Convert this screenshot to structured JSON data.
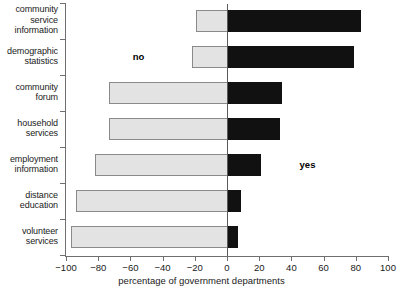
{
  "chart_data": {
    "type": "bar",
    "orientation": "horizontal",
    "subtype": "diverging-stacked",
    "title": "",
    "xlabel": "percentage of government departments",
    "ylabel": "",
    "xlim": [
      -100,
      100
    ],
    "xticks": [
      -100,
      -80,
      -60,
      -40,
      -20,
      0,
      20,
      40,
      60,
      80,
      100
    ],
    "xtick_labels": [
      "−100",
      "−80",
      "−60",
      "−40",
      "−20",
      "0",
      "20",
      "40",
      "60",
      "80",
      "100"
    ],
    "grid": false,
    "legend": {
      "position": "inline",
      "entries": [
        {
          "name": "no",
          "color": "#e3e3e3",
          "label": "no"
        },
        {
          "name": "yes",
          "color": "#111111",
          "label": "yes"
        }
      ]
    },
    "annotations": [
      {
        "text": "no",
        "x": -55,
        "row": 1
      },
      {
        "text": "yes",
        "x": 50,
        "row": 4
      }
    ],
    "categories": [
      "community service information",
      "demographic statistics",
      "community forum",
      "household services",
      "employment information",
      "distance education",
      "volunteer services"
    ],
    "category_lines": [
      [
        "community",
        "service",
        "information"
      ],
      [
        "demographic",
        "statistics"
      ],
      [
        "community",
        "forum"
      ],
      [
        "household",
        "services"
      ],
      [
        "employment",
        "information"
      ],
      [
        "distance",
        "education"
      ],
      [
        "volunteer",
        "services"
      ]
    ],
    "series": [
      {
        "name": "no",
        "color": "#e3e3e3",
        "values": [
          -19,
          -22,
          -73,
          -73,
          -82,
          -94,
          -97
        ]
      },
      {
        "name": "yes",
        "color": "#111111",
        "values": [
          83,
          79,
          34,
          33,
          21,
          9,
          7
        ]
      }
    ]
  }
}
